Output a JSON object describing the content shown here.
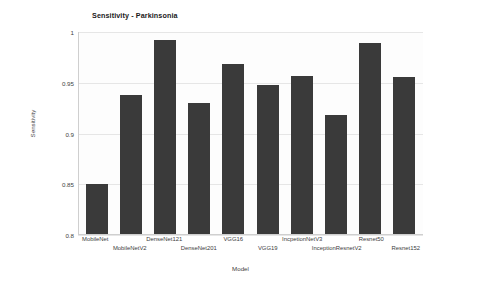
{
  "chart_data": {
    "type": "bar",
    "title": "Sensitivity - Parkinsonia",
    "xlabel": "Model",
    "ylabel": "Sensitivity",
    "ylim": [
      0.8,
      1.0
    ],
    "yticks": [
      "0.8",
      "0.85",
      "0.9",
      "0.95",
      "1"
    ],
    "ytick_values": [
      0.8,
      0.85,
      0.9,
      0.95,
      1.0
    ],
    "grid": true,
    "legend": "none",
    "bar_color": "#3a3a3a",
    "categories": [
      "MobileNet",
      "MobileNetV2",
      "DenseNet121",
      "DenseNet201",
      "VGG16",
      "VGG19",
      "IncpetionNetV3",
      "InceptionResnetV2",
      "Resnet50",
      "Resnet152"
    ],
    "values": [
      0.85,
      0.938,
      0.992,
      0.93,
      0.968,
      0.948,
      0.957,
      0.918,
      0.989,
      0.956
    ]
  }
}
